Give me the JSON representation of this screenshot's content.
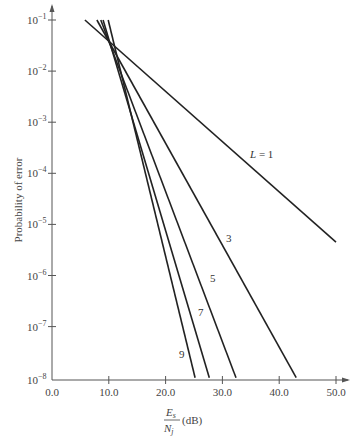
{
  "chart_data": {
    "type": "line",
    "title": "",
    "xlabel": "Es/Nj (dB)",
    "xlabel_parts": {
      "numerator": "E",
      "numerator_sub": "s",
      "denominator": "N",
      "denominator_sub": "j",
      "unit": "(dB)"
    },
    "ylabel": "Probability of error",
    "xscale": "linear",
    "yscale": "log",
    "xlim": [
      0,
      50
    ],
    "ylim": [
      1e-08,
      0.1
    ],
    "x_ticks": [
      0,
      10,
      20,
      30,
      40,
      50
    ],
    "x_tick_labels": [
      "0.0",
      "10.0",
      "20.0",
      "30.0",
      "40.0",
      "50.0"
    ],
    "y_ticks": [
      -1,
      -2,
      -3,
      -4,
      -5,
      -6,
      -7,
      -8
    ],
    "y_tick_labels": [
      "10",
      "10",
      "10",
      "10",
      "10",
      "10",
      "10",
      "10"
    ],
    "y_tick_exponents": [
      "−1",
      "−2",
      "−3",
      "−4",
      "−5",
      "−6",
      "−7",
      "−8"
    ],
    "grid": false,
    "legend": "inline labels on curves",
    "series": [
      {
        "name": "L = 1",
        "label": "L = 1",
        "x": [
          5.8,
          50.0
        ],
        "y": [
          0.1,
          4.5e-06
        ],
        "label_pos": [
          250,
          158
        ]
      },
      {
        "name": "L = 3",
        "label": "3",
        "x": [
          7.9,
          43.0
        ],
        "y": [
          0.1,
          1e-08
        ],
        "label_pos": [
          226,
          242
        ]
      },
      {
        "name": "L = 5",
        "label": "5",
        "x": [
          8.6,
          32.4
        ],
        "y": [
          0.1,
          1e-08
        ],
        "label_pos": [
          210,
          282
        ]
      },
      {
        "name": "L = 7",
        "label": "7",
        "x": [
          9.0,
          27.7
        ],
        "y": [
          0.1,
          1e-08
        ],
        "label_pos": [
          198,
          316
        ]
      },
      {
        "name": "L = 9",
        "label": "9",
        "x": [
          9.9,
          25.2
        ],
        "y": [
          0.1,
          1e-08
        ],
        "label_pos": [
          179,
          358
        ]
      }
    ]
  },
  "layout": {
    "origin_x": 52,
    "px_per_db": 5.68,
    "top_decade_y": 20,
    "px_per_decade": 51.1,
    "axis_bottom_y": 378
  }
}
